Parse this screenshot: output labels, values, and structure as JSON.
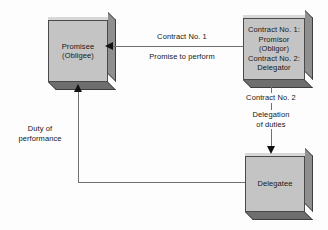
{
  "diagram": {
    "colors": {
      "box_fill": "#c4c4c4",
      "box_side": "#8f8f8f",
      "box_bottom": "#6e6e6e",
      "box_border": "#4a4a4a",
      "connector": "#707070",
      "arrowhead": "#111111",
      "text": "#161616",
      "background": "#fdfdfd"
    },
    "nodes": [
      {
        "id": "promisee",
        "label": "Promisee\n(Obligee)",
        "role": "Promisee (Obligee)"
      },
      {
        "id": "promisor",
        "label": "Contract No. 1:\nPromisor\n(Obligor)\nContract No. 2:\nDelegator",
        "role": "Promisor (Obligor) / Delegator"
      },
      {
        "id": "delegatee",
        "label": "Delegatee",
        "role": "Delegatee"
      }
    ],
    "connectors": [
      {
        "id": "contract1",
        "from": "promisor",
        "to": "promisee",
        "direction": "left",
        "label_above": "Contract No. 1",
        "label_below": "Promise to perform"
      },
      {
        "id": "contract2",
        "from": "promisor",
        "to": "delegatee",
        "direction": "down",
        "label_top": "Contract No. 2",
        "label_bottom": "Delegation\nof duties"
      },
      {
        "id": "duty",
        "from": "delegatee",
        "to": "promisee",
        "direction": "up",
        "label": "Duty of\nperformance"
      }
    ]
  }
}
